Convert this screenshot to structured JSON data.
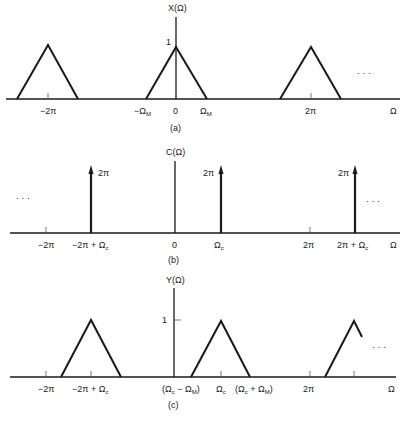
{
  "panels": {
    "a": {
      "caption": "(a)",
      "ylabel": "X(Ω)",
      "peak_label": "1",
      "xaxis_label": "Ω",
      "ellipsis": "· · ·",
      "ticks": {
        "neg2pi": "−2π",
        "negOmegaM": "−Ω",
        "negOmegaM_sub": "M",
        "zero": "0",
        "omegaM": "Ω",
        "omegaM_sub": "M",
        "twopi": "2π"
      }
    },
    "b": {
      "caption": "(b)",
      "ylabel": "C(Ω)",
      "xaxis_label": "Ω",
      "ellipsis_left": "· · ·",
      "ellipsis_right": "· · ·",
      "impulse_label": "2π",
      "ticks": {
        "neg2pi": "−2π",
        "neg2pi_plus_omegac": "−2π + Ω",
        "c_sub": "c",
        "zero": "0",
        "omegac": "Ω",
        "twopi": "2π",
        "twopi_plus_omegac": "2π + Ω"
      }
    },
    "c": {
      "caption": "(c)",
      "ylabel": "Y(Ω)",
      "peak_label": "1",
      "xaxis_label": "Ω",
      "ellipsis": "· · ·",
      "ticks": {
        "neg2pi": "−2π",
        "neg2pi_plus_omegac": "−2π + Ω",
        "c_sub": "c",
        "M_sub": "M",
        "omegac_minus_omegaM_open": "(Ω",
        "minus": " − Ω",
        "close": ")",
        "omegac": "Ω",
        "omegac_plus_omegaM_open": "(Ω",
        "plus": " + Ω",
        "twopi": "2π"
      }
    }
  }
}
